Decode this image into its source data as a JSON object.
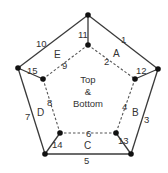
{
  "diagram": {
    "type": "pentagon-net",
    "center_label": [
      "Top",
      "&",
      "Bottom"
    ],
    "faces": [
      "A",
      "B",
      "C",
      "D",
      "E"
    ],
    "edges": {
      "outer": [
        {
          "label": "1",
          "from": "outer-top",
          "to": "outer-right"
        },
        {
          "label": "3",
          "from": "outer-right",
          "to": "outer-bottom-right"
        },
        {
          "label": "5",
          "from": "outer-bottom-right",
          "to": "outer-bottom-left"
        },
        {
          "label": "7",
          "from": "outer-bottom-left",
          "to": "outer-left"
        },
        {
          "label": "10",
          "from": "outer-left",
          "to": "outer-top"
        }
      ],
      "inner_dashed": [
        {
          "label": "2",
          "from": "inner-top",
          "to": "inner-right"
        },
        {
          "label": "4",
          "from": "inner-right",
          "to": "inner-bottom-right"
        },
        {
          "label": "6",
          "from": "inner-bottom-right",
          "to": "inner-bottom-left"
        },
        {
          "label": "8",
          "from": "inner-bottom-left",
          "to": "inner-left"
        },
        {
          "label": "9",
          "from": "inner-left",
          "to": "inner-top"
        }
      ],
      "spokes": [
        {
          "label": "11",
          "from": "outer-top",
          "to": "inner-top"
        },
        {
          "label": "12",
          "from": "outer-right",
          "to": "inner-right"
        },
        {
          "label": "13",
          "from": "outer-bottom-right",
          "to": "inner-bottom-right"
        },
        {
          "label": "14",
          "from": "outer-bottom-left",
          "to": "inner-bottom-left"
        },
        {
          "label": "15",
          "from": "outer-left",
          "to": "inner-left"
        }
      ]
    },
    "colors": {
      "line": "#3a3a3a",
      "vertex": "#111111",
      "text": "#333333"
    }
  }
}
